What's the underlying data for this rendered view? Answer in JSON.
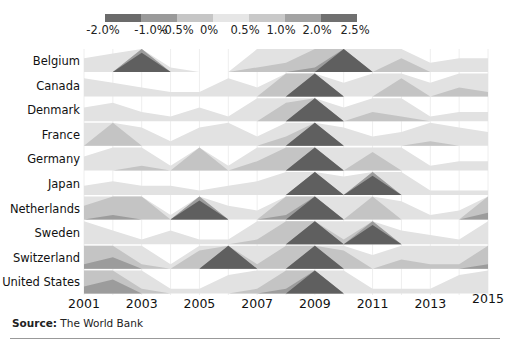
{
  "chart_data": {
    "type": "horizon",
    "title": "",
    "xlabel": "",
    "ylabel": "",
    "x": [
      2001,
      2002,
      2003,
      2004,
      2005,
      2006,
      2007,
      2008,
      2009,
      2010,
      2011,
      2012,
      2013,
      2014,
      2015
    ],
    "x_tick_labels": [
      "2001",
      "2003",
      "2005",
      "2007",
      "2009",
      "2011",
      "2013",
      "2015"
    ],
    "legend": {
      "labels": [
        "-2.0%",
        "-1.0%",
        "-0.5%",
        "0%",
        "0.5%",
        "1.0%",
        "2.0%",
        "2.5%"
      ],
      "colors": [
        "#6b6b6b",
        "#9a9a9a",
        "#c6c6c6",
        "#e6e6e6",
        "#c9c9c9",
        "#a3a3a3",
        "#707070"
      ]
    },
    "band_thresholds": [
      0.5,
      1.0,
      2.0
    ],
    "series": [
      {
        "name": "Belgium",
        "values": [
          0.3,
          0.4,
          2.5,
          0.1,
          0.0,
          0.0,
          0.6,
          0.7,
          1.2,
          2.8,
          0.5,
          0.8,
          0.2,
          0.3,
          0.3
        ]
      },
      {
        "name": "Canada",
        "values": [
          0.4,
          0.3,
          0.2,
          0.1,
          0.1,
          0.4,
          0.2,
          1.0,
          2.6,
          0.3,
          0.5,
          0.9,
          0.3,
          0.7,
          0.6
        ]
      },
      {
        "name": "Denmark",
        "values": [
          0.3,
          0.4,
          0.2,
          0.1,
          0.3,
          0.1,
          0.5,
          0.9,
          2.6,
          0.3,
          0.7,
          0.6,
          0.1,
          0.2,
          0.2
        ]
      },
      {
        "name": "France",
        "values": [
          0.5,
          1.0,
          0.4,
          0.1,
          0.4,
          0.5,
          0.2,
          0.7,
          2.6,
          0.4,
          0.2,
          0.3,
          0.6,
          0.4,
          0.3
        ]
      },
      {
        "name": "Germany",
        "values": [
          0.3,
          0.5,
          0.6,
          0.1,
          1.0,
          0.1,
          0.7,
          1.0,
          2.6,
          0.5,
          0.9,
          0.5,
          0.1,
          0.2,
          0.2
        ]
      },
      {
        "name": "Japan",
        "values": [
          0.2,
          0.3,
          0.2,
          0.2,
          0.1,
          0.2,
          0.3,
          0.5,
          2.6,
          0.4,
          2.5,
          0.5,
          0.1,
          0.1,
          0.1
        ]
      },
      {
        "name": "Netherlands",
        "values": [
          0.8,
          1.2,
          1.0,
          0.1,
          2.5,
          0.3,
          0.2,
          1.2,
          2.6,
          0.5,
          1.0,
          0.4,
          0.1,
          0.2,
          1.3
        ]
      },
      {
        "name": "Sweden",
        "values": [
          0.5,
          0.3,
          0.1,
          0.3,
          0.1,
          0.1,
          0.6,
          1.0,
          2.6,
          0.6,
          2.5,
          0.3,
          0.2,
          0.1,
          0.5
        ]
      },
      {
        "name": "Switzerland",
        "values": [
          1.2,
          1.5,
          0.6,
          0.1,
          0.9,
          2.6,
          0.6,
          1.0,
          2.6,
          0.9,
          0.3,
          0.7,
          0.6,
          0.6,
          1.2
        ]
      },
      {
        "name": "United States",
        "values": [
          1.3,
          1.6,
          0.6,
          0.1,
          0.1,
          0.4,
          0.6,
          1.2,
          2.6,
          0.5,
          0.1,
          0.1,
          0.1,
          0.4,
          0.5
        ]
      }
    ]
  },
  "source": {
    "label": "Source:",
    "text": " The World Bank"
  }
}
